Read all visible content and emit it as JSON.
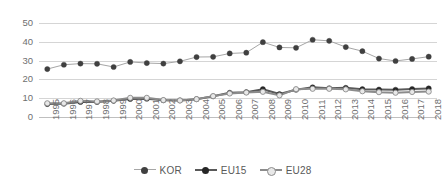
{
  "chart_data": {
    "type": "line",
    "title": "",
    "subtitle": "",
    "xlabel": "",
    "ylabel": "",
    "grid": true,
    "legend_position": "bottom",
    "ylim": [
      0,
      50
    ],
    "yticks": [
      0,
      10,
      20,
      30,
      40,
      50
    ],
    "categories": [
      "1995",
      "1996",
      "1997",
      "1998",
      "1999",
      "2000",
      "2001",
      "2002",
      "2003",
      "2004",
      "2005",
      "2006",
      "2007",
      "2008",
      "2009",
      "2010",
      "2011",
      "2012",
      "2013",
      "2014",
      "2015",
      "2016",
      "2017",
      "2018"
    ],
    "series": [
      {
        "name": "KOR",
        "color": "#404040",
        "line_color": "#a6a6a6",
        "line_width": 1,
        "marker": "circle",
        "marker_fill": "#404040",
        "values": [
          25.5,
          27.8,
          28.4,
          28.3,
          26.6,
          29.3,
          28.7,
          28.4,
          29.6,
          31.9,
          32.0,
          33.8,
          34.2,
          39.8,
          37.0,
          36.8,
          41.1,
          40.5,
          37.2,
          35.0,
          31.1,
          29.8,
          30.9,
          32.1
        ]
      },
      {
        "name": "EU15",
        "color": "#404040",
        "line_color": "#595959",
        "line_width": 2,
        "marker": "circle",
        "marker_fill": "#262626",
        "values": [
          6.9,
          7.1,
          8.0,
          8.0,
          8.6,
          9.6,
          9.7,
          8.9,
          8.8,
          9.5,
          11.0,
          12.9,
          13.2,
          14.8,
          12.2,
          14.5,
          15.8,
          15.3,
          15.5,
          14.8,
          14.6,
          14.5,
          14.9,
          15.2
        ]
      },
      {
        "name": "EU28",
        "color": "#d9d9d9",
        "line_color": "#8c8c8c",
        "line_width": 2,
        "marker": "circle",
        "marker_fill": "#e8e8e8",
        "values": [
          7.3,
          7.3,
          8.6,
          8.3,
          8.8,
          10.2,
          10.2,
          9.0,
          8.8,
          9.5,
          11.1,
          12.5,
          13.0,
          13.4,
          11.5,
          14.8,
          15.0,
          15.0,
          14.7,
          13.7,
          13.2,
          12.9,
          13.3,
          13.5
        ]
      }
    ]
  },
  "legend": {
    "items": [
      {
        "label": "KOR"
      },
      {
        "label": "EU15"
      },
      {
        "label": "EU28"
      }
    ]
  },
  "colors": {
    "gridline": "#d5d5d5",
    "axis_text": "#6f6f6f",
    "background": "#ffffff"
  }
}
